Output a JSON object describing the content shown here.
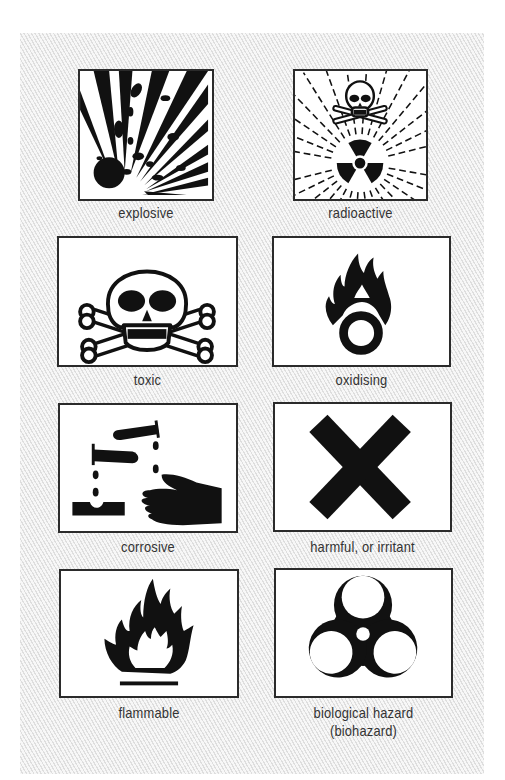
{
  "symbols": [
    {
      "id": "explosive",
      "label": "explosive",
      "icon": "explosive-icon"
    },
    {
      "id": "radioactive",
      "label": "radioactive",
      "icon": "radioactive-icon"
    },
    {
      "id": "toxic",
      "label": "toxic",
      "icon": "skull-crossbones-icon"
    },
    {
      "id": "oxidising",
      "label": "oxidising",
      "icon": "flame-over-circle-icon"
    },
    {
      "id": "corrosive",
      "label": "corrosive",
      "icon": "corrosive-icon"
    },
    {
      "id": "harmful",
      "label": "harmful, or irritant",
      "icon": "saint-andrew-cross-icon"
    },
    {
      "id": "flammable",
      "label": "flammable",
      "icon": "flame-icon"
    },
    {
      "id": "biohazard",
      "label_line1": "biological hazard",
      "label_line2": "(biohazard)",
      "icon": "biohazard-icon"
    }
  ],
  "colors": {
    "ink": "#111111",
    "label": "#333333",
    "box_border": "#2b2b2b",
    "stripe": "#dedede"
  }
}
